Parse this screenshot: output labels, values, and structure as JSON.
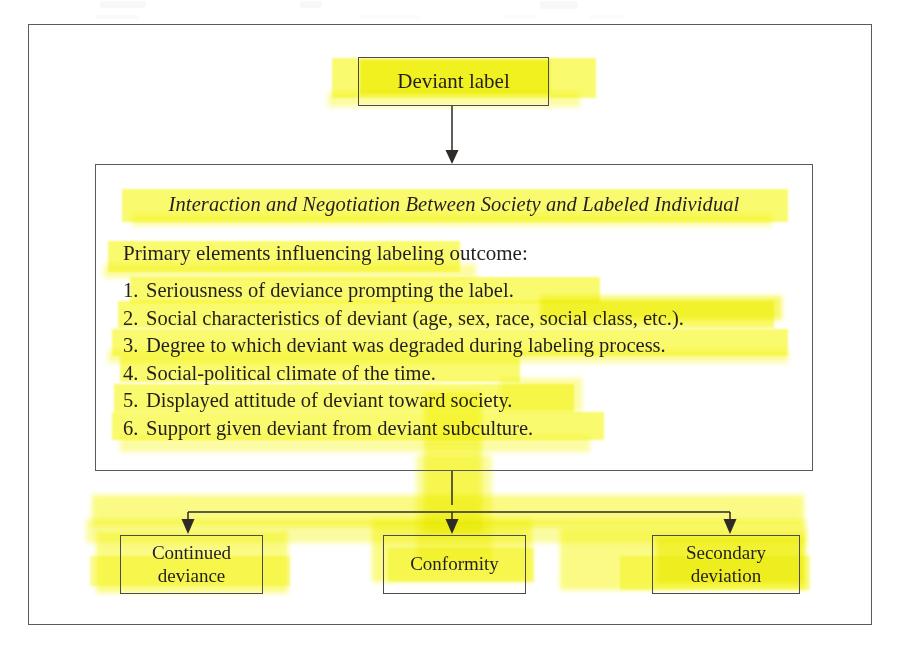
{
  "diagram": {
    "top_node": {
      "label": "Deviant label"
    },
    "panel": {
      "title": "Interaction and Negotiation Between Society and Labeled Individual",
      "intro": "Primary elements influencing labeling outcome:",
      "items": [
        {
          "num": "1.",
          "text": "Seriousness of deviance prompting the label."
        },
        {
          "num": "2.",
          "text": "Social characteristics of deviant (age, sex, race, social class, etc.)."
        },
        {
          "num": "3.",
          "text": "Degree to which deviant was degraded during labeling process."
        },
        {
          "num": "4.",
          "text": "Social-political climate of the time."
        },
        {
          "num": "5.",
          "text": "Displayed attitude of deviant toward society."
        },
        {
          "num": "6.",
          "text": "Support given deviant from deviant subculture."
        }
      ]
    },
    "outcomes": [
      {
        "label": "Continued\ndeviance"
      },
      {
        "label": "Conformity"
      },
      {
        "label": "Secondary\ndeviation"
      }
    ]
  },
  "colors": {
    "highlighter": "#fafa6e",
    "highlighter_pale": "#fbfb93",
    "highlighter_deep": "#f6f64a",
    "ink": "#231f1c",
    "border": "#5a5a5e",
    "page": "#ffffff"
  }
}
